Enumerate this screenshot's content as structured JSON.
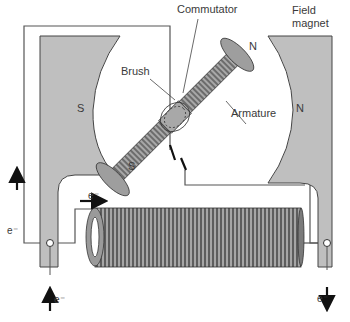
{
  "diagram": {
    "labels": {
      "commutator": "Commutator",
      "field_magnet_line1": "Field",
      "field_magnet_line2": "magnet",
      "brush": "Brush",
      "armature": "Armature"
    },
    "poles": {
      "left_field": "S",
      "right_field": "N",
      "armature_top": "N",
      "armature_bottom": "S"
    },
    "electron_labels": {
      "left_up": "e⁻",
      "top_right": "e⁻",
      "bottom_in": "e⁻",
      "bottom_out": "e⁻"
    },
    "colors": {
      "magnet_fill": "#bfbfbf",
      "armature_fill": "#9e9e9e",
      "outline": "#444444",
      "wire": "#555555",
      "coil": "#6a6a6a",
      "background": "#ffffff"
    }
  }
}
